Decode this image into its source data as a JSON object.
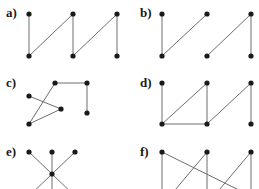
{
  "labels": {
    "a": "a)",
    "b": "b)",
    "c": "c)",
    "d": "d)",
    "e": "e)",
    "f": "f)"
  },
  "colors": {
    "edge": "#6e6e6e",
    "node": "#1a1a1a"
  }
}
